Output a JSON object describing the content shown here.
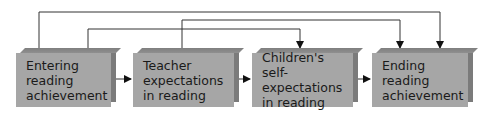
{
  "diagram": {
    "type": "path-diagram",
    "colors": {
      "box_face": "#a6a6a6",
      "box_side": "#7b7b7b",
      "box_top": "#8a8a8a",
      "line": "#222222",
      "background": "#ffffff"
    },
    "nodes": [
      {
        "id": "entering",
        "label": "Entering reading\nachievement"
      },
      {
        "id": "teacher",
        "label": "Teacher\nexpectations\nin reading"
      },
      {
        "id": "children",
        "label": "Children's\nself-expectations\nin reading"
      },
      {
        "id": "ending",
        "label": "Ending reading\nachievement"
      }
    ],
    "edges": [
      {
        "from": "entering",
        "to": "teacher",
        "route": "direct"
      },
      {
        "from": "teacher",
        "to": "children",
        "route": "direct"
      },
      {
        "from": "children",
        "to": "ending",
        "route": "direct"
      },
      {
        "from": "entering",
        "to": "ending",
        "route": "overhead-top"
      },
      {
        "from": "teacher",
        "to": "ending",
        "route": "overhead-middle"
      },
      {
        "from": "entering",
        "to": "children",
        "route": "overhead-low"
      }
    ]
  }
}
